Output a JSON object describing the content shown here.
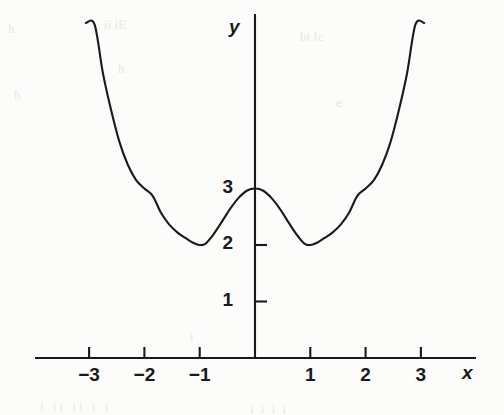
{
  "figure": {
    "background_color": "#fcfcfa",
    "ink_color": "#1a1a1a",
    "axis_label_x": "x",
    "axis_label_y": "y"
  },
  "bleed_through": {
    "b1": "h",
    "b2": "ii iE",
    "b3": "h",
    "b4": "h",
    "b5": "bi Ic",
    "b6": "e",
    "b7": "i ii  ii i  i",
    "b8": "i i   i i",
    "b9": "i"
  },
  "chart_data": {
    "type": "line",
    "title": "",
    "xlabel": "x",
    "ylabel": "y",
    "grid": false,
    "legend": null,
    "xlim": [
      -3.4,
      3.9
    ],
    "ylim": [
      0,
      6.0
    ],
    "x_ticks": [
      -3,
      -2,
      -1,
      1,
      2,
      3
    ],
    "x_tick_labels": [
      "−3",
      "−2",
      "−1",
      "1",
      "2",
      "3"
    ],
    "y_ticks": [
      1,
      2,
      3
    ],
    "y_tick_labels": [
      "1",
      "2",
      "3"
    ],
    "annotations": [],
    "series": [
      {
        "name": "curve",
        "description": "quartic with local maximum at x=0 (y=3) and local minima at x=±1 (y=2)",
        "formula": "y = x^4 - 2x^2 + 3",
        "color": "#1a1a1a",
        "line_width": 2.1,
        "x_domain": [
          -3.06,
          3.06
        ],
        "x": [
          -3.06,
          -2.9,
          -2.75,
          -2.6,
          -2.45,
          -2.3,
          -2.15,
          -2.0,
          -1.85,
          -1.7,
          -1.55,
          -1.4,
          -1.25,
          -1.1,
          -1.0,
          -0.9,
          -0.75,
          -0.6,
          -0.45,
          -0.3,
          -0.15,
          0,
          0.15,
          0.3,
          0.45,
          0.6,
          0.75,
          0.9,
          1.0,
          1.1,
          1.25,
          1.4,
          1.55,
          1.7,
          1.85,
          2.0,
          2.15,
          2.3,
          2.45,
          2.6,
          2.75,
          2.9,
          3.06
        ],
        "y": [
          5.93,
          5.9,
          5.04,
          4.38,
          3.82,
          3.42,
          3.15,
          3.0,
          2.87,
          2.57,
          2.36,
          2.22,
          2.12,
          2.03,
          2.0,
          2.02,
          2.19,
          2.41,
          2.64,
          2.83,
          2.96,
          3.0,
          2.96,
          2.83,
          2.64,
          2.41,
          2.19,
          2.02,
          2.0,
          2.03,
          2.12,
          2.22,
          2.36,
          2.57,
          2.87,
          3.0,
          3.15,
          3.42,
          3.82,
          4.38,
          5.04,
          5.9,
          5.93
        ]
      }
    ]
  }
}
